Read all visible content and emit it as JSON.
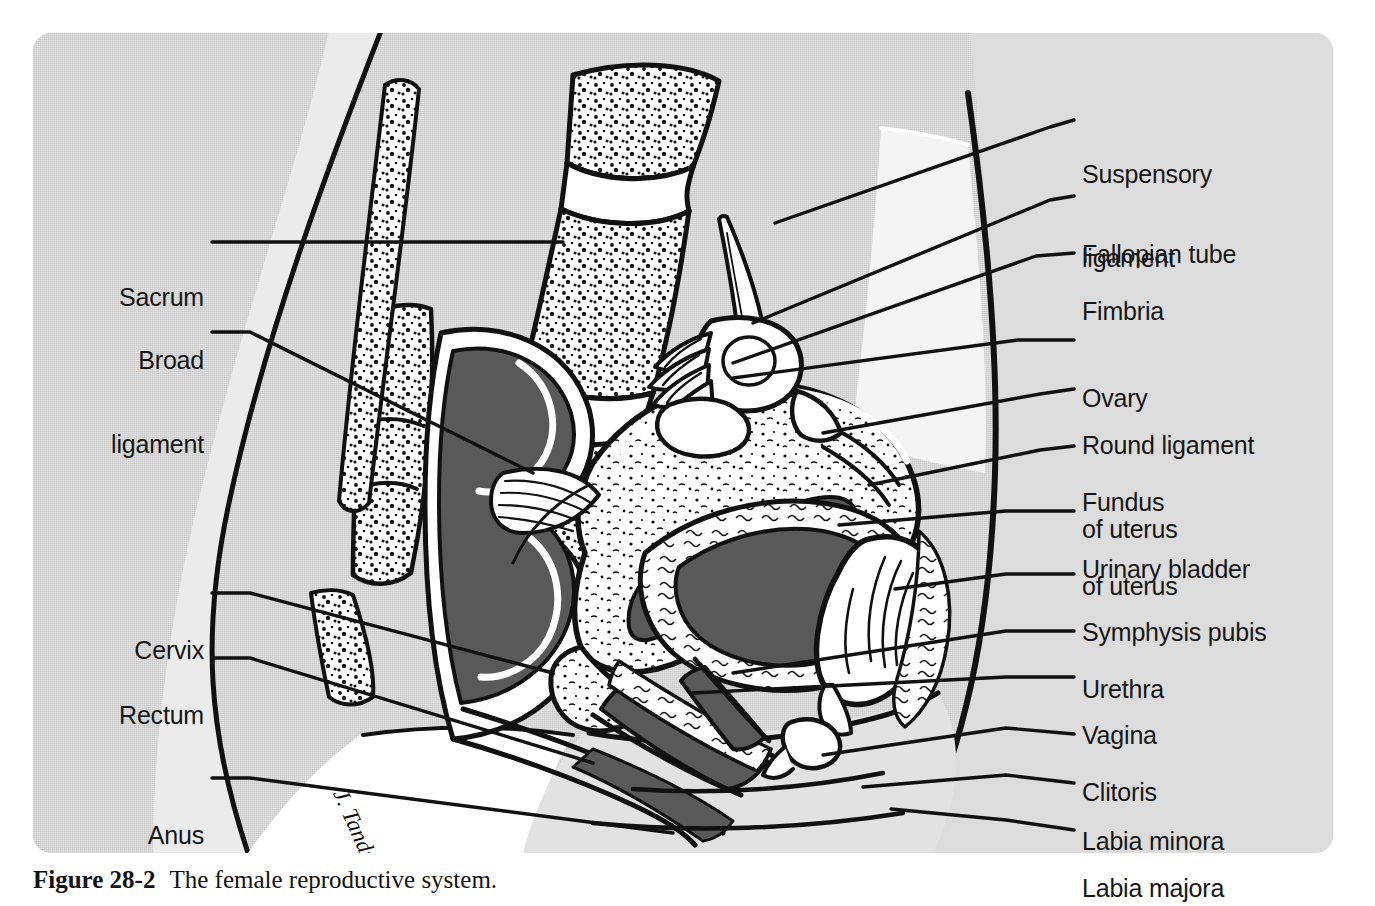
{
  "figure": {
    "panel_bg": "#c9c9c9",
    "ink": "#111111",
    "lumen_fill": "#595959",
    "tissue_fill": "#ffffff",
    "soft_fill": "#d8d8d8",
    "signature": "J. Tands"
  },
  "caption": {
    "number": "Figure 28-2",
    "text": "The female reproductive system."
  },
  "labels_right": [
    {
      "id": "suspensory-ligament",
      "line1": "Suspensory",
      "line2": "ligament",
      "x": 1082,
      "y": 104,
      "lead": [
        [
          1074,
          120
        ],
        [
          1050,
          127
        ]
      ]
    },
    {
      "id": "fallopian-tube",
      "line1": "Fallopian tube",
      "line2": "",
      "x": 1082,
      "y": 184,
      "lead": [
        [
          1074,
          196
        ],
        [
          1050,
          200
        ]
      ]
    },
    {
      "id": "fimbria",
      "line1": "Fimbria",
      "line2": "",
      "x": 1082,
      "y": 241,
      "lead": [
        [
          1074,
          253
        ],
        [
          1036,
          256
        ]
      ]
    },
    {
      "id": "ovary",
      "line1": "Ovary",
      "line2": "",
      "x": 1082,
      "y": 328,
      "lead": [
        [
          1074,
          340
        ],
        [
          1018,
          340
        ]
      ]
    },
    {
      "id": "round-ligament",
      "line1": "Round ligament",
      "line2": "of uterus",
      "x": 1082,
      "y": 375,
      "lead": [
        [
          1074,
          389
        ],
        [
          1040,
          394
        ]
      ]
    },
    {
      "id": "fundus-of-uterus",
      "line1": "Fundus",
      "line2": "of uterus",
      "x": 1082,
      "y": 432,
      "lead": [
        [
          1074,
          446
        ],
        [
          1040,
          450
        ]
      ]
    },
    {
      "id": "urinary-bladder",
      "line1": "Urinary bladder",
      "line2": "",
      "x": 1082,
      "y": 499,
      "lead": [
        [
          1074,
          511
        ],
        [
          1006,
          511
        ]
      ]
    },
    {
      "id": "symphysis-pubis",
      "line1": "Symphysis pubis",
      "line2": "",
      "x": 1082,
      "y": 562,
      "lead": [
        [
          1074,
          574
        ],
        [
          1006,
          574
        ]
      ]
    },
    {
      "id": "urethra",
      "line1": "Urethra",
      "line2": "",
      "x": 1082,
      "y": 619,
      "lead": [
        [
          1074,
          631
        ],
        [
          1006,
          631
        ]
      ]
    },
    {
      "id": "vagina",
      "line1": "Vagina",
      "line2": "",
      "x": 1082,
      "y": 665,
      "lead": [
        [
          1074,
          677
        ],
        [
          1006,
          677
        ]
      ]
    },
    {
      "id": "clitoris",
      "line1": "Clitoris",
      "line2": "",
      "x": 1082,
      "y": 722,
      "lead": [
        [
          1074,
          734
        ],
        [
          1006,
          728
        ]
      ]
    },
    {
      "id": "labia-minora",
      "line1": "Labia minora",
      "line2": "",
      "x": 1082,
      "y": 771,
      "lead": [
        [
          1074,
          783
        ],
        [
          1006,
          775
        ]
      ]
    },
    {
      "id": "labia-majora",
      "line1": "Labia majora",
      "line2": "",
      "x": 1082,
      "y": 818,
      "lead": [
        [
          1074,
          830
        ],
        [
          1006,
          820
        ]
      ]
    }
  ],
  "labels_left": [
    {
      "id": "sacrum",
      "line1": "Sacrum",
      "line2": "",
      "x": 204,
      "y": 227,
      "lead": [
        [
          212,
          242
        ],
        [
          246,
          242
        ]
      ]
    },
    {
      "id": "broad-ligament",
      "line1": "Broad",
      "line2": "ligament",
      "x": 204,
      "y": 290,
      "lead": [
        [
          212,
          332
        ],
        [
          250,
          332
        ]
      ]
    },
    {
      "id": "cervix",
      "line1": "Cervix",
      "line2": "",
      "x": 204,
      "y": 580,
      "lead": [
        [
          212,
          593
        ],
        [
          250,
          593
        ]
      ]
    },
    {
      "id": "rectum",
      "line1": "Rectum",
      "line2": "",
      "x": 204,
      "y": 645,
      "lead": [
        [
          212,
          658
        ],
        [
          250,
          658
        ]
      ]
    },
    {
      "id": "anus",
      "line1": "Anus",
      "line2": "",
      "x": 204,
      "y": 765,
      "lead": [
        [
          212,
          778
        ],
        [
          250,
          778
        ]
      ]
    }
  ]
}
